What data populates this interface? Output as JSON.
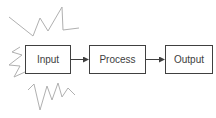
{
  "diagram": {
    "type": "flowchart",
    "nodes": [
      {
        "id": "input",
        "label": "Input",
        "highlighted": true
      },
      {
        "id": "process",
        "label": "Process"
      },
      {
        "id": "output",
        "label": "Output"
      }
    ],
    "edges": [
      {
        "from": "input",
        "to": "process"
      },
      {
        "from": "process",
        "to": "output"
      }
    ],
    "colors": {
      "stroke": "#404040",
      "burst": "#b0b0b0",
      "background": "#ffffff"
    }
  }
}
